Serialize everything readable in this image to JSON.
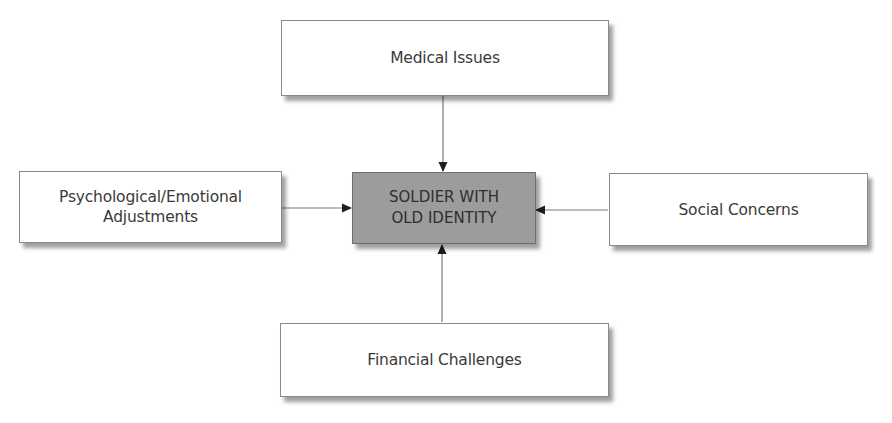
{
  "diagram": {
    "type": "hub-and-spoke",
    "center": {
      "id": "center",
      "label": "SOLDIER WITH\nOLD IDENTITY",
      "fill": "#9c9c9c"
    },
    "nodes": [
      {
        "id": "top",
        "label": "Medical Issues",
        "position": "top"
      },
      {
        "id": "left",
        "label": "Psychological/Emotional\nAdjustments",
        "position": "left"
      },
      {
        "id": "right",
        "label": "Social Concerns",
        "position": "right"
      },
      {
        "id": "bottom",
        "label": "Financial Challenges",
        "position": "bottom"
      }
    ],
    "edges": [
      {
        "from": "top",
        "to": "center",
        "arrow": "end"
      },
      {
        "from": "left",
        "to": "center",
        "arrow": "end"
      },
      {
        "from": "right",
        "to": "center",
        "arrow": "end"
      },
      {
        "from": "bottom",
        "to": "center",
        "arrow": "end"
      }
    ],
    "colors": {
      "line": "#7a7a7a",
      "arrowhead": "#1e1e1e",
      "box_border": "#8a8a8a",
      "text": "#3a3a3a"
    }
  }
}
